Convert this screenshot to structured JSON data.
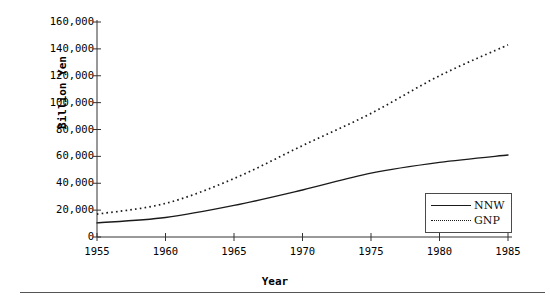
{
  "chart_data": {
    "type": "line",
    "title": "",
    "xlabel": "Year",
    "ylabel": "Billion Yen",
    "xlim": [
      1955,
      1985
    ],
    "ylim": [
      0,
      160000
    ],
    "grid": false,
    "legend_position": "bottom-right",
    "x_ticks": [
      "1955",
      "1960",
      "1965",
      "1970",
      "1975",
      "1980",
      "1985"
    ],
    "y_ticks": [
      "0",
      "20,000",
      "40,000",
      "60,000",
      "80,000",
      "100,000",
      "120,000",
      "140,000",
      "160,000"
    ],
    "x": [
      1955,
      1960,
      1965,
      1970,
      1975,
      1980,
      1985
    ],
    "series": [
      {
        "name": "NNW",
        "style": "solid",
        "color": "#1a1a1a",
        "values": [
          10500,
          14500,
          23500,
          35000,
          47500,
          55500,
          61000
        ]
      },
      {
        "name": "GNP",
        "style": "dotted",
        "color": "#1a1a1a",
        "values": [
          17000,
          25000,
          43500,
          68000,
          92000,
          120000,
          143000
        ]
      }
    ]
  },
  "legend": {
    "items": [
      {
        "label": "NNW",
        "style": "solid"
      },
      {
        "label": "GNP",
        "style": "dotted"
      }
    ]
  },
  "axes": {
    "y_title": "Billion Yen",
    "x_title": "Year"
  }
}
